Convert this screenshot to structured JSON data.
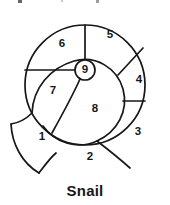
{
  "meta": {
    "diagram_type": "spiral-snail-shell-segments",
    "background_color": "#ffffff",
    "line_color": "#17171a",
    "label_color": "#17171a"
  },
  "caption": {
    "text": "Snail"
  },
  "artifacts": {
    "note": "faint dark specks along the very top edge, remnants of a text line cropped above the figure",
    "count": 3
  },
  "figure": {
    "name": "snail-shell",
    "center": {
      "x": 85,
      "y": 83
    },
    "outer_radius": 60,
    "core": {
      "name": "core-circle",
      "label": "9",
      "cx": 85,
      "cy": 68,
      "r": 10
    },
    "segments": [
      {
        "id": "segment-1",
        "label": "1",
        "label_x": 42,
        "label_y": 135,
        "position": "outer-spiral-tail-lower-left"
      },
      {
        "id": "segment-2",
        "label": "2",
        "label_y": 155,
        "label_x": 90,
        "position": "bottom"
      },
      {
        "id": "segment-3",
        "label": "3",
        "label_x": 138,
        "label_y": 130,
        "position": "lower-right"
      },
      {
        "id": "segment-4",
        "label": "4",
        "label_x": 139,
        "label_y": 78,
        "position": "right"
      },
      {
        "id": "segment-5",
        "label": "5",
        "label_x": 110,
        "label_y": 33,
        "position": "upper-right"
      },
      {
        "id": "segment-6",
        "label": "6",
        "label_x": 62,
        "label_y": 42,
        "position": "upper-left"
      },
      {
        "id": "segment-7",
        "label": "7",
        "label_x": 53,
        "label_y": 89,
        "position": "left"
      },
      {
        "id": "segment-8",
        "label": "8",
        "label_x": 95,
        "label_y": 107,
        "position": "inner-whorl"
      },
      {
        "id": "segment-9",
        "label": "9",
        "label_x": 85,
        "label_y": 68,
        "position": "core"
      }
    ],
    "segment_count": 9
  }
}
